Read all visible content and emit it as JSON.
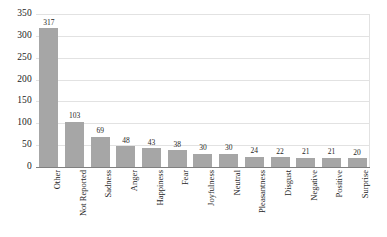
{
  "chart_data": {
    "type": "bar",
    "title": "",
    "subtitle": "",
    "xlabel": "",
    "ylabel": "",
    "ylim": [
      0,
      350
    ],
    "yticks": [
      0,
      50,
      100,
      150,
      200,
      250,
      300,
      350
    ],
    "ytick_labels": [
      "0",
      "50",
      "100",
      "150",
      "200",
      "250",
      "300",
      "350"
    ],
    "grid": true,
    "legend": false,
    "legend_position": "none",
    "orientation": "vertical",
    "bar_color": "#a6a6a6",
    "gridline_color": "#e2e2e2",
    "axis_color": "#808080",
    "data_labels_shown": true,
    "categories": [
      "Other",
      "Not Reported",
      "Sadness",
      "Anger",
      "Happiness",
      "Fear",
      "Joyfulness",
      "Neutral",
      "Pleasantness",
      "Disgust",
      "Negative",
      "Positive",
      "Surprise"
    ],
    "values": [
      317,
      103,
      69,
      48,
      43,
      38,
      30,
      30,
      24,
      22,
      21,
      21,
      20
    ],
    "value_labels": [
      "317",
      "103",
      "69",
      "48",
      "43",
      "38",
      "30",
      "30",
      "24",
      "22",
      "21",
      "21",
      "20"
    ]
  }
}
